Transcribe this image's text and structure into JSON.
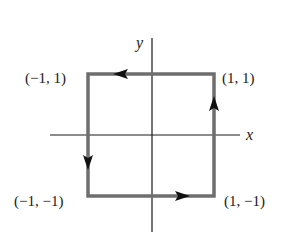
{
  "diagram": {
    "axes": {
      "x_label": "x",
      "y_label": "y"
    },
    "path": {
      "shape": "square",
      "orientation": "counterclockwise",
      "color": "#6e6e6e",
      "vertices": [
        {
          "label": "(1, 1)"
        },
        {
          "label": "(−1, 1)"
        },
        {
          "label": "(−1, −1)"
        },
        {
          "label": "(1, −1)"
        }
      ]
    },
    "colors": {
      "axis": "#1a1a1a",
      "arrow": "#111111",
      "background": "#ffffff"
    }
  }
}
